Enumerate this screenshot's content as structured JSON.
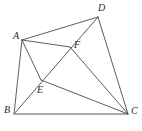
{
  "figure": {
    "type": "geometry-diagram",
    "stroke_color": "#4a4a52",
    "base_stroke_color": "#8e8e96",
    "background_color": "#ffffff",
    "canvas": {
      "width": 142,
      "height": 131
    },
    "points": [
      {
        "id": "A",
        "label": "A",
        "x": 22,
        "y": 40,
        "label_x": 13,
        "label_y": 31
      },
      {
        "id": "B",
        "label": "B",
        "x": 14,
        "y": 114,
        "label_x": 4,
        "label_y": 105
      },
      {
        "id": "C",
        "label": "C",
        "x": 128,
        "y": 114,
        "label_x": 131,
        "label_y": 106
      },
      {
        "id": "D",
        "label": "D",
        "x": 98,
        "y": 17,
        "label_x": 98,
        "label_y": 3
      },
      {
        "id": "E",
        "label": "E",
        "x": 41,
        "y": 80,
        "label_x": 37,
        "label_y": 85
      },
      {
        "id": "F",
        "label": "F",
        "x": 70,
        "y": 47,
        "label_x": 74,
        "label_y": 40
      }
    ],
    "segments": [
      {
        "name": "A-D",
        "from": "A",
        "to": "D",
        "style": "thin"
      },
      {
        "name": "A-B",
        "from": "A",
        "to": "B",
        "style": "thin"
      },
      {
        "name": "A-F",
        "from": "A",
        "to": "F",
        "style": "thin"
      },
      {
        "name": "A-E",
        "from": "A",
        "to": "E",
        "style": "thin"
      },
      {
        "name": "B-D",
        "from": "B",
        "to": "D",
        "style": "thin"
      },
      {
        "name": "B-C",
        "from": "B",
        "to": "C",
        "style": "base"
      },
      {
        "name": "E-C",
        "from": "E",
        "to": "C",
        "style": "thin"
      },
      {
        "name": "F-C",
        "from": "F",
        "to": "C",
        "style": "thin"
      },
      {
        "name": "D-C",
        "from": "D",
        "to": "C",
        "style": "thin"
      }
    ]
  }
}
